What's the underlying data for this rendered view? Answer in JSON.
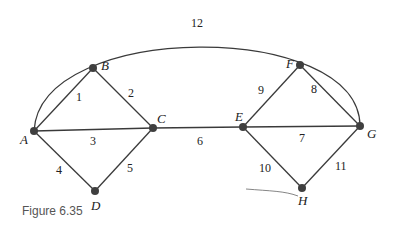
{
  "caption": "Figure 6.35",
  "nodes": {
    "A": {
      "label": "A",
      "x": 34,
      "y": 131
    },
    "B": {
      "label": "B",
      "x": 93,
      "y": 68
    },
    "C": {
      "label": "C",
      "x": 153,
      "y": 128
    },
    "D": {
      "label": "D",
      "x": 95,
      "y": 191
    },
    "E": {
      "label": "E",
      "x": 243,
      "y": 127
    },
    "F": {
      "label": "F",
      "x": 300,
      "y": 65
    },
    "G": {
      "label": "G",
      "x": 360,
      "y": 126
    },
    "H": {
      "label": "H",
      "x": 302,
      "y": 188
    }
  },
  "edges": [
    {
      "from": "A",
      "to": "B",
      "weight": "1"
    },
    {
      "from": "B",
      "to": "C",
      "weight": "2"
    },
    {
      "from": "A",
      "to": "C",
      "weight": "3"
    },
    {
      "from": "A",
      "to": "D",
      "weight": "4"
    },
    {
      "from": "D",
      "to": "C",
      "weight": "5"
    },
    {
      "from": "C",
      "to": "E",
      "weight": "6"
    },
    {
      "from": "E",
      "to": "G",
      "weight": "7"
    },
    {
      "from": "F",
      "to": "G",
      "weight": "8"
    },
    {
      "from": "E",
      "to": "F",
      "weight": "9"
    },
    {
      "from": "E",
      "to": "H",
      "weight": "10"
    },
    {
      "from": "H",
      "to": "G",
      "weight": "11"
    },
    {
      "from": "A",
      "to": "G",
      "weight": "12",
      "curved": true
    }
  ]
}
